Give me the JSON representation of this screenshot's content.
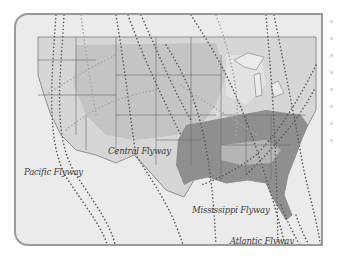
{
  "map": {
    "title": "North American Flyways",
    "region": "Contiguous United States",
    "colors": {
      "background": "#ebebeb",
      "frame_border": "#9a9a9a",
      "land_light": "#d9d9d9",
      "land_mid": "#bdbdbd",
      "land_dark": "#8c8c8c",
      "state_border": "#6a6a6a",
      "flyway_dots": "#5a5a5a",
      "flyway_dots_light": "#a8a8a8",
      "label_text": "#3a3a3a"
    },
    "labels": [
      {
        "id": "pacific",
        "text": "Pacific Flyway"
      },
      {
        "id": "central",
        "text": "Central Flyway"
      },
      {
        "id": "mississippi",
        "text": "Mississippi Flyway"
      },
      {
        "id": "atlantic",
        "text": "Atlantic Flyway"
      }
    ]
  }
}
